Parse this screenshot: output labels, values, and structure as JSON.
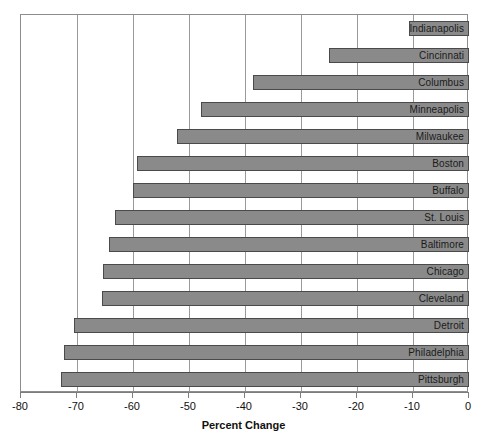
{
  "chart_data": {
    "type": "bar",
    "orientation": "horizontal",
    "title": "",
    "xlabel": "Percent Change",
    "ylabel": "",
    "xlim": [
      -80,
      0
    ],
    "ylim": null,
    "grid": true,
    "legend": false,
    "xticks": [
      -80,
      -70,
      -60,
      -50,
      -40,
      -30,
      -20,
      -10,
      0
    ],
    "xtick_labels": [
      "-80",
      "-70",
      "-60",
      "-50",
      "-40",
      "-30",
      "-20",
      "-10",
      "0"
    ],
    "categories": [
      "Indianapolis",
      "Cincinnati",
      "Columbus",
      "Minneapolis",
      "Milwaukee",
      "Boston",
      "Buffalo",
      "St. Louis",
      "Baltimore",
      "Chicago",
      "Cleveland",
      "Detroit",
      "Philadelphia",
      "Pittsburgh"
    ],
    "values": [
      -10.7,
      -25.0,
      -38.6,
      -47.9,
      -52.1,
      -59.3,
      -60.0,
      -63.2,
      -64.3,
      -65.4,
      -65.5,
      -70.5,
      -72.3,
      -72.9
    ],
    "bar_color": "#8a8a8a",
    "bar_edge_color": "#4a4a4a",
    "grid_color": "#9a9a9a",
    "axis_color": "#7d7d7d",
    "background_color": "#ffffff"
  },
  "axis": {
    "x_title": "Percent Change"
  }
}
